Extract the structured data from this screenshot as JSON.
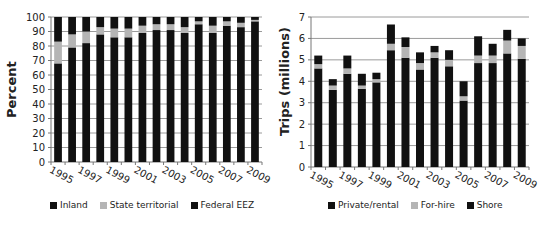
{
  "chart_data": [
    {
      "type": "bar",
      "stacked": true,
      "title": "",
      "xlabel": "",
      "ylabel": "Percent",
      "ylim": [
        0,
        100
      ],
      "yticks": [
        0,
        10,
        20,
        30,
        40,
        50,
        60,
        70,
        80,
        90,
        100
      ],
      "grid": true,
      "legend_position": "bottom",
      "categories": [
        "1995",
        "1996",
        "1997",
        "1998",
        "1999",
        "2000",
        "2001",
        "2002",
        "2003",
        "2004",
        "2005",
        "2006",
        "2007",
        "2008",
        "2009"
      ],
      "xtick_labels": [
        "1995",
        "1997",
        "1999",
        "2001",
        "2003",
        "2005",
        "2007",
        "2009"
      ],
      "series": [
        {
          "name": "Inland",
          "color": "#111111",
          "values": [
            68,
            79,
            82,
            88,
            86,
            86,
            89,
            91,
            91,
            89,
            95,
            89,
            94,
            93,
            97
          ]
        },
        {
          "name": "State territorial",
          "color": "#b5b5b5",
          "values": [
            15,
            9,
            8,
            5,
            6,
            6,
            5,
            4,
            4,
            4,
            2,
            5,
            3,
            3,
            1
          ]
        },
        {
          "name": "Federal EEZ",
          "color": "#111111",
          "values": [
            17,
            12,
            10,
            7,
            8,
            8,
            6,
            5,
            5,
            7,
            3,
            6,
            3,
            4,
            2
          ]
        }
      ]
    },
    {
      "type": "bar",
      "stacked": true,
      "title": "",
      "xlabel": "",
      "ylabel": "Trips (millions)",
      "ylim": [
        0,
        7
      ],
      "yticks": [
        0,
        1,
        2,
        3,
        4,
        5,
        6,
        7
      ],
      "grid": true,
      "legend_position": "bottom",
      "categories": [
        "1995",
        "1996",
        "1997",
        "1998",
        "1999",
        "2000",
        "2001",
        "2002",
        "2003",
        "2004",
        "2005",
        "2006",
        "2007",
        "2008",
        "2009"
      ],
      "xtick_labels": [
        "1995",
        "1997",
        "1999",
        "2001",
        "2003",
        "2005",
        "2007",
        "2009"
      ],
      "series": [
        {
          "name": "Private/rental",
          "color": "#111111",
          "values": [
            4.6,
            3.6,
            4.35,
            3.65,
            3.95,
            5.45,
            5.1,
            4.55,
            5.1,
            4.7,
            3.1,
            4.85,
            4.85,
            5.3,
            5.05
          ]
        },
        {
          "name": "For-hire",
          "color": "#b5b5b5",
          "values": [
            0.2,
            0.2,
            0.25,
            0.15,
            0.15,
            0.3,
            0.5,
            0.3,
            0.25,
            0.3,
            0.2,
            0.35,
            0.35,
            0.6,
            0.6
          ]
        },
        {
          "name": "Shore",
          "color": "#111111",
          "values": [
            0.4,
            0.3,
            0.6,
            0.55,
            0.3,
            0.9,
            0.45,
            0.5,
            0.3,
            0.45,
            0.7,
            0.9,
            0.55,
            0.5,
            0.35
          ]
        }
      ]
    }
  ],
  "left": {
    "ylabel": "Percent",
    "legend": [
      "Inland",
      "State territorial",
      "Federal EEZ"
    ]
  },
  "right": {
    "ylabel": "Trips (millions)",
    "legend": [
      "Private/rental",
      "For-hire",
      "Shore"
    ]
  }
}
